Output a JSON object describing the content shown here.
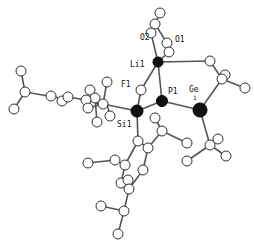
{
  "diagram": {
    "type": "molecular-structure-ortep",
    "labels": [
      {
        "id": "O2",
        "text": "O2",
        "x": 146,
        "y": 41
      },
      {
        "id": "O1",
        "text": "O1",
        "x": 175,
        "y": 42
      },
      {
        "id": "Li1",
        "text": "Li1",
        "x": 133,
        "y": 66
      },
      {
        "id": "F1",
        "text": "F1",
        "x": 124,
        "y": 86
      },
      {
        "id": "P1",
        "text": "P1",
        "x": 168,
        "y": 94
      },
      {
        "id": "Ge1",
        "text": "Ge",
        "x": 190,
        "y": 92
      },
      {
        "id": "Ge1sub",
        "text": "1",
        "x": 194,
        "y": 99
      },
      {
        "id": "Si1",
        "text": "Si1",
        "x": 115,
        "y": 125
      }
    ],
    "heavy_atoms": [
      {
        "id": "Li1",
        "x": 158,
        "y": 62,
        "r": 5
      },
      {
        "id": "P1",
        "x": 162,
        "y": 101,
        "r": 5.5
      },
      {
        "id": "Ge1",
        "x": 200,
        "y": 110,
        "r": 7
      },
      {
        "id": "Si1",
        "x": 137,
        "y": 111,
        "r": 6
      }
    ]
  }
}
